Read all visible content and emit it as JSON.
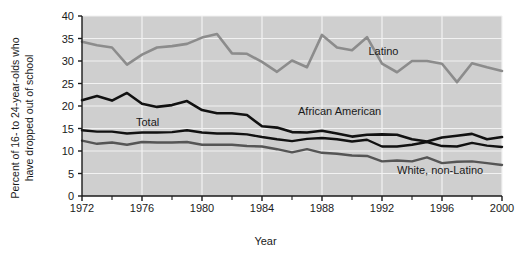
{
  "chart_data": {
    "type": "line",
    "title": "",
    "xlabel": "Year",
    "ylabel": "Percent of 16- to 24-year-olds who\nhave dropped out of school",
    "xlim": [
      1972,
      2000
    ],
    "ylim": [
      0,
      40
    ],
    "grid": true,
    "legend_position": "inline-annotations",
    "plot_background": "#cfcfcf",
    "gridline_color": "#f2f2f2",
    "xticks": [
      1972,
      1976,
      1980,
      1984,
      1988,
      1992,
      1996,
      2000
    ],
    "xtick_labels": [
      "1972",
      "1976",
      "1980",
      "1984",
      "1988",
      "1992",
      "1996",
      "2000"
    ],
    "xminorticks": [
      1974,
      1978,
      1982,
      1986,
      1990,
      1994,
      1998
    ],
    "yticks": [
      0,
      5,
      10,
      15,
      20,
      25,
      30,
      35,
      40
    ],
    "ytick_labels": [
      "0",
      "5",
      "10",
      "15",
      "20",
      "25",
      "30",
      "35",
      "40"
    ],
    "x": [
      1972,
      1973,
      1974,
      1975,
      1976,
      1977,
      1978,
      1979,
      1980,
      1981,
      1982,
      1983,
      1984,
      1985,
      1986,
      1987,
      1988,
      1989,
      1990,
      1991,
      1992,
      1993,
      1994,
      1995,
      1996,
      1997,
      1998,
      1999,
      2000
    ],
    "series": [
      {
        "name": "Latino",
        "color": "#8c8c8c",
        "width": 2.6,
        "label_x": 1991.1,
        "label_y": 32.0,
        "values": [
          34.3,
          33.5,
          33.0,
          29.2,
          31.4,
          33.0,
          33.3,
          33.8,
          35.2,
          36.0,
          31.7,
          31.6,
          29.8,
          27.6,
          30.1,
          28.6,
          35.8,
          33.0,
          32.4,
          35.3,
          29.4,
          27.5,
          30.0,
          30.0,
          29.4,
          25.3,
          29.5,
          28.6,
          27.8
        ]
      },
      {
        "name": "African American",
        "color": "#111111",
        "width": 2.6,
        "label_x": 1986.4,
        "label_y": 18.6,
        "values": [
          21.3,
          22.2,
          21.2,
          22.9,
          20.5,
          19.8,
          20.2,
          21.1,
          19.1,
          18.4,
          18.4,
          18.0,
          15.5,
          15.2,
          14.2,
          14.1,
          14.5,
          13.9,
          13.2,
          13.6,
          13.7,
          13.6,
          12.6,
          12.1,
          13.0,
          13.4,
          13.8,
          12.6,
          13.1
        ]
      },
      {
        "name": "Total",
        "color": "#111111",
        "width": 2.4,
        "label_x": 1975.6,
        "label_y": 16.2,
        "values": [
          14.6,
          14.3,
          14.3,
          13.9,
          14.1,
          14.1,
          14.2,
          14.6,
          14.1,
          13.9,
          13.9,
          13.7,
          13.1,
          12.6,
          12.2,
          12.7,
          12.9,
          12.6,
          12.1,
          12.5,
          11.0,
          11.0,
          11.4,
          12.0,
          11.1,
          11.0,
          11.8,
          11.2,
          10.9
        ]
      },
      {
        "name": "White, non-Latino",
        "color": "#555555",
        "width": 2.4,
        "label_x": 1993.0,
        "label_y": 5.6,
        "values": [
          12.3,
          11.6,
          11.9,
          11.4,
          12.0,
          11.9,
          11.9,
          12.0,
          11.4,
          11.4,
          11.4,
          11.1,
          11.0,
          10.4,
          9.7,
          10.4,
          9.6,
          9.4,
          9.0,
          8.9,
          7.7,
          7.9,
          7.7,
          8.6,
          7.3,
          7.6,
          7.7,
          7.3,
          6.9
        ]
      }
    ]
  }
}
